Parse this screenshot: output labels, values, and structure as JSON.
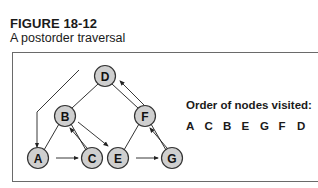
{
  "figure": {
    "label": "FIGURE 18-12",
    "caption": "A postorder traversal"
  },
  "tree": {
    "nodes": [
      {
        "id": "D",
        "label": "D",
        "x": 105,
        "y": 76
      },
      {
        "id": "B",
        "label": "B",
        "x": 65,
        "y": 116
      },
      {
        "id": "F",
        "label": "F",
        "x": 145,
        "y": 116
      },
      {
        "id": "A",
        "label": "A",
        "x": 38,
        "y": 158
      },
      {
        "id": "C",
        "label": "C",
        "x": 92,
        "y": 158
      },
      {
        "id": "E",
        "label": "E",
        "x": 118,
        "y": 158
      },
      {
        "id": "G",
        "label": "G",
        "x": 172,
        "y": 158
      }
    ],
    "edges": [
      [
        "D",
        "B"
      ],
      [
        "D",
        "F"
      ],
      [
        "B",
        "A"
      ],
      [
        "B",
        "C"
      ],
      [
        "F",
        "E"
      ],
      [
        "F",
        "G"
      ]
    ],
    "node_fill": "#cfcfcf",
    "node_stroke": "#333333"
  },
  "order": {
    "title": "Order of nodes visited:",
    "sequence": [
      "A",
      "C",
      "B",
      "E",
      "G",
      "F",
      "D"
    ]
  }
}
